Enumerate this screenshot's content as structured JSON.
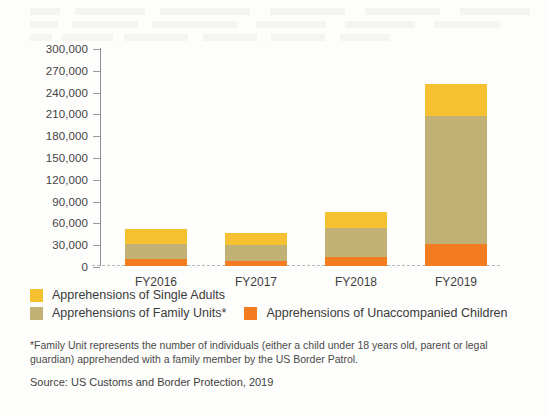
{
  "chart_data": {
    "type": "bar",
    "stacked": true,
    "title": "",
    "xlabel": "",
    "ylabel": "",
    "categories": [
      "FY2016",
      "FY2017",
      "FY2018",
      "FY2019"
    ],
    "ylim": [
      0,
      300000
    ],
    "ytick_step": 30000,
    "yticks": [
      "300,000",
      "270,000",
      "240,000",
      "210,000",
      "180,000",
      "150,000",
      "120,000",
      "90,000",
      "60,000",
      "30,000",
      "0"
    ],
    "grid": false,
    "legend_position": "below-plot",
    "series": [
      {
        "name": "Apprehensions of Single Adults",
        "color": "#F5C130",
        "values": [
          21000,
          16000,
          22000,
          45000
        ]
      },
      {
        "name": "Apprehensions of Family Units*",
        "color": "#C2B174",
        "values": [
          20000,
          22000,
          41000,
          176000
        ]
      },
      {
        "name": "Apprehensions of Unaccompanied Children",
        "color": "#F47C20",
        "values": [
          10000,
          7000,
          12000,
          30000
        ]
      }
    ],
    "totals": [
      51000,
      45000,
      75000,
      251000
    ],
    "footnote": "*Family Unit represents the number of individuals (either a child under 18 years old, parent or legal guardian) apprehended with a family member by the US Border Patrol.",
    "source": "Source: US Customs and Border Protection, 2019"
  }
}
